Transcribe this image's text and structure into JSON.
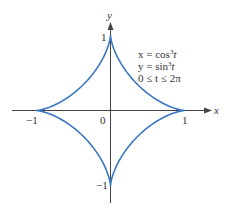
{
  "chart_data": {
    "type": "line",
    "title": "",
    "equations": [
      "x = cos³t",
      "y = sin³t",
      "0 ≤ t ≤ 2π"
    ],
    "xlabel": "x",
    "ylabel": "y",
    "xlim": [
      -1,
      1
    ],
    "ylim": [
      -1,
      1
    ],
    "x_ticks": [
      "-1",
      "0",
      "1"
    ],
    "y_ticks": [
      "1",
      "-1"
    ],
    "grid": false,
    "legend": null,
    "series": [
      {
        "name": "astroid",
        "color": "#3a78c4",
        "points": [
          {
            "x": 1,
            "y": 0
          },
          {
            "x": 0.354,
            "y": 0.354
          },
          {
            "x": 0,
            "y": 1
          },
          {
            "x": -0.354,
            "y": 0.354
          },
          {
            "x": -1,
            "y": 0
          },
          {
            "x": -0.354,
            "y": -0.354
          },
          {
            "x": 0,
            "y": -1
          },
          {
            "x": 0.354,
            "y": -0.354
          }
        ]
      }
    ]
  },
  "labels": {
    "x_axis": "x",
    "y_axis": "y",
    "origin": "0",
    "x_neg1": "−1",
    "x_pos1": "1",
    "y_pos1": "1",
    "y_neg1": "−1",
    "eq1_prefix": "x = cos",
    "eq2_prefix": "y = sin",
    "exp": "3",
    "t": "t",
    "eq3": "0 ≤ t ≤ 2π"
  },
  "colors": {
    "curve": "#3a78c4",
    "axis": "#444444"
  }
}
